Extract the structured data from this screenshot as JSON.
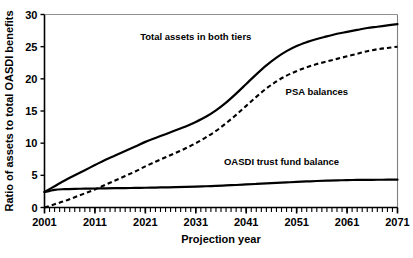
{
  "chart_data": {
    "type": "line",
    "title": "",
    "xlabel": "Projection year",
    "ylabel": "Ratio of assets to total OASDI benefits",
    "xlim": [
      2001,
      2071
    ],
    "ylim": [
      0,
      30
    ],
    "grid": false,
    "legend_position": "inline-annotations",
    "xticks": [
      2001,
      2011,
      2021,
      2031,
      2041,
      2051,
      2061,
      2071
    ],
    "xtick_labels": [
      "2001",
      "2011",
      "2021",
      "2031",
      "2041",
      "2051",
      "2061",
      "2071"
    ],
    "x_minor_tick_interval": 1,
    "yticks": [
      0,
      5,
      10,
      15,
      20,
      25,
      30
    ],
    "ytick_labels": [
      "0",
      "5",
      "10",
      "15",
      "20",
      "25",
      "30"
    ],
    "series": [
      {
        "name": "Total assets in both tiers",
        "style": "solid",
        "color": "#000000",
        "x": [
          2001,
          2003,
          2005,
          2007,
          2009,
          2011,
          2013,
          2015,
          2017,
          2019,
          2021,
          2023,
          2025,
          2027,
          2029,
          2031,
          2033,
          2035,
          2037,
          2039,
          2041,
          2043,
          2045,
          2047,
          2049,
          2051,
          2053,
          2055,
          2057,
          2059,
          2061,
          2063,
          2065,
          2067,
          2069,
          2071
        ],
        "values": [
          2.4,
          3.3,
          4.2,
          5.0,
          5.8,
          6.6,
          7.4,
          8.1,
          8.8,
          9.5,
          10.2,
          10.8,
          11.4,
          12.0,
          12.6,
          13.3,
          14.1,
          15.1,
          16.3,
          17.7,
          19.2,
          20.7,
          22.1,
          23.3,
          24.3,
          25.1,
          25.7,
          26.2,
          26.6,
          27.0,
          27.3,
          27.6,
          27.9,
          28.1,
          28.3,
          28.5
        ]
      },
      {
        "name": "PSA balances",
        "style": "dashed",
        "color": "#000000",
        "x": [
          2001,
          2003,
          2005,
          2007,
          2009,
          2011,
          2013,
          2015,
          2017,
          2019,
          2021,
          2023,
          2025,
          2027,
          2029,
          2031,
          2033,
          2035,
          2037,
          2039,
          2041,
          2043,
          2045,
          2047,
          2049,
          2051,
          2053,
          2055,
          2057,
          2059,
          2061,
          2063,
          2065,
          2067,
          2069,
          2071
        ],
        "values": [
          0.0,
          0.5,
          1.0,
          1.6,
          2.2,
          2.8,
          3.5,
          4.2,
          4.9,
          5.6,
          6.4,
          7.1,
          7.8,
          8.5,
          9.2,
          10.0,
          10.9,
          11.9,
          13.1,
          14.4,
          15.8,
          17.2,
          18.5,
          19.6,
          20.5,
          21.2,
          21.8,
          22.3,
          22.7,
          23.1,
          23.5,
          23.9,
          24.3,
          24.6,
          24.8,
          25.0
        ]
      },
      {
        "name": "OASDI trust fund balance",
        "style": "solid",
        "color": "#000000",
        "x": [
          2001,
          2003,
          2005,
          2007,
          2009,
          2011,
          2013,
          2015,
          2017,
          2019,
          2021,
          2023,
          2025,
          2027,
          2029,
          2031,
          2033,
          2035,
          2037,
          2039,
          2041,
          2043,
          2045,
          2047,
          2049,
          2051,
          2053,
          2055,
          2057,
          2059,
          2061,
          2063,
          2065,
          2067,
          2069,
          2071
        ],
        "values": [
          2.4,
          2.75,
          2.85,
          2.9,
          2.92,
          2.95,
          2.97,
          3.0,
          3.02,
          3.05,
          3.07,
          3.1,
          3.13,
          3.16,
          3.2,
          3.24,
          3.3,
          3.36,
          3.43,
          3.5,
          3.58,
          3.66,
          3.74,
          3.82,
          3.9,
          3.98,
          4.05,
          4.12,
          4.18,
          4.22,
          4.26,
          4.28,
          4.3,
          4.31,
          4.32,
          4.33
        ]
      }
    ],
    "annotations": [
      {
        "text": "Total assets in both tiers",
        "x": 2031,
        "y": 26.0
      },
      {
        "text": "PSA balances",
        "x": 2055,
        "y": 17.5
      },
      {
        "text": "OASDI trust fund balance",
        "x": 2048,
        "y": 6.6
      }
    ]
  }
}
